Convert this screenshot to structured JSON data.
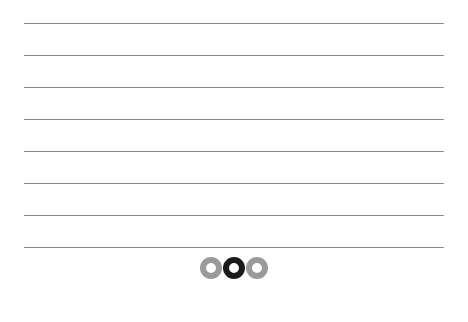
{
  "page": {
    "type": "lined-sheet",
    "rule_count": 8,
    "rule_y": [
      23,
      55,
      87,
      119,
      151,
      183,
      215,
      247
    ],
    "rule_color": "#8a8a8a"
  },
  "pager": {
    "total_pages": 3,
    "current_page": 2,
    "dots": [
      {
        "label": "page-1",
        "active": false
      },
      {
        "label": "page-2",
        "active": true
      },
      {
        "label": "page-3",
        "active": false
      }
    ],
    "active_color": "#1a1a1a",
    "inactive_color": "#9a9a9a"
  }
}
